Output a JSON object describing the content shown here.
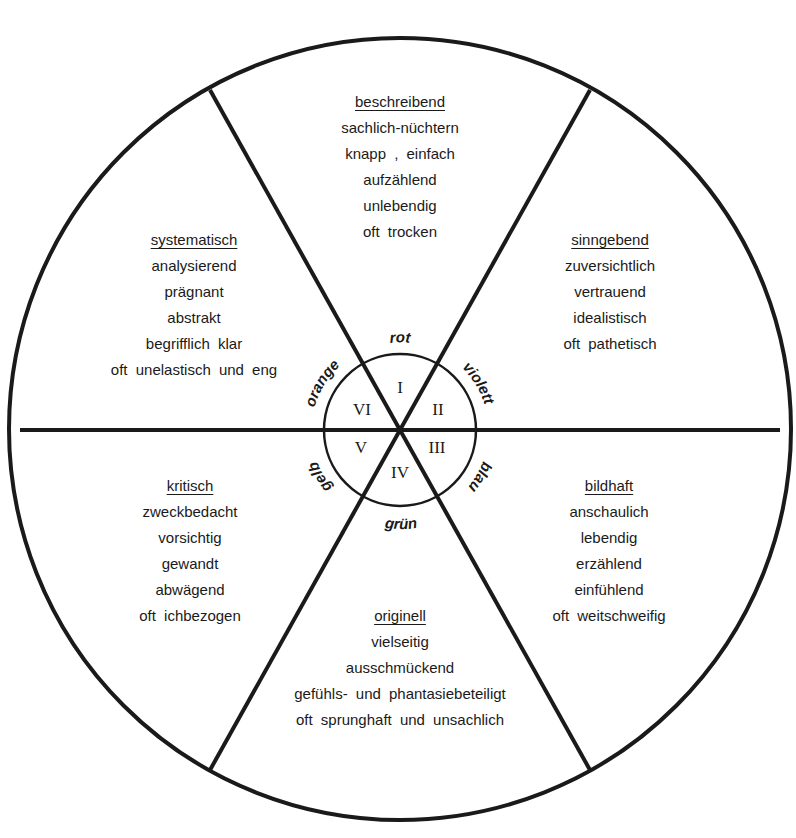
{
  "diagram": {
    "center_labels": {
      "colors": [
        "rot",
        "violett",
        "blau",
        "grün",
        "gelb",
        "orange"
      ],
      "numerals": [
        "I",
        "II",
        "III",
        "IV",
        "V",
        "VI"
      ]
    },
    "sectors": [
      {
        "id": "I",
        "color": "rot",
        "title": "beschreibend",
        "lines": [
          "sachlich-nüchtern",
          "knapp , einfach",
          "aufzählend",
          "unlebendig",
          "oft trocken"
        ]
      },
      {
        "id": "II",
        "color": "violett",
        "title": "sinngebend",
        "lines": [
          "zuversichtlich",
          "vertrauend",
          "idealistisch",
          "oft pathetisch"
        ]
      },
      {
        "id": "III",
        "color": "blau",
        "title": "bildhaft",
        "lines": [
          "anschaulich",
          "lebendig",
          "erzählend",
          "einfühlend",
          "oft weitschweifig"
        ]
      },
      {
        "id": "IV",
        "color": "grün",
        "title": "originell",
        "lines": [
          "vielseitig",
          "ausschmückend",
          "gefühls- und phantasiebeteiligt",
          "oft sprunghaft und unsachlich"
        ]
      },
      {
        "id": "V",
        "color": "gelb",
        "title": "kritisch",
        "lines": [
          "zweckbedacht",
          "vorsichtig",
          "gewandt",
          "abwägend",
          "oft ichbezogen"
        ]
      },
      {
        "id": "VI",
        "color": "orange",
        "title": "systematisch",
        "lines": [
          "analysierend",
          "prägnant",
          "abstrakt",
          "begrifflich klar",
          "oft unelastisch und eng"
        ]
      }
    ]
  }
}
